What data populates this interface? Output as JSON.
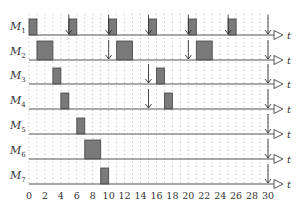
{
  "chart_data": {
    "type": "gantt",
    "title": "",
    "xlabel": "t",
    "ylabel": "",
    "xlim": [
      0,
      30
    ],
    "x_ticks": [
      0,
      2,
      4,
      6,
      8,
      10,
      12,
      14,
      16,
      18,
      20,
      22,
      24,
      26,
      28,
      30
    ],
    "grid": "dotted vertical at every unit",
    "rows": [
      {
        "name": "M1",
        "label_main": "M",
        "label_sub": "1",
        "blocks": [
          [
            0,
            1
          ],
          [
            5,
            6
          ],
          [
            10,
            11
          ],
          [
            15,
            16
          ],
          [
            20,
            21
          ],
          [
            25,
            26
          ]
        ],
        "arrows": [
          5,
          10,
          15,
          20,
          25,
          30
        ]
      },
      {
        "name": "M2",
        "label_main": "M",
        "label_sub": "2",
        "blocks": [
          [
            1,
            3
          ],
          [
            11,
            13
          ],
          [
            21,
            23
          ]
        ],
        "arrows": [
          10,
          20,
          30
        ]
      },
      {
        "name": "M3",
        "label_main": "M",
        "label_sub": "3",
        "blocks": [
          [
            3,
            4
          ],
          [
            16,
            17
          ]
        ],
        "arrows": [
          15,
          30
        ]
      },
      {
        "name": "M4",
        "label_main": "M",
        "label_sub": "4",
        "blocks": [
          [
            4,
            5
          ],
          [
            17,
            18
          ]
        ],
        "arrows": [
          15,
          30
        ]
      },
      {
        "name": "M5",
        "label_main": "M",
        "label_sub": "5",
        "blocks": [
          [
            6,
            7
          ]
        ],
        "arrows": [
          30
        ]
      },
      {
        "name": "M6",
        "label_main": "M",
        "label_sub": "6",
        "blocks": [
          [
            7,
            9
          ]
        ],
        "arrows": [
          30
        ]
      },
      {
        "name": "M7",
        "label_main": "M",
        "label_sub": "7",
        "blocks": [
          [
            9,
            10
          ]
        ],
        "arrows": [
          30
        ]
      }
    ]
  },
  "colors": {
    "block_fill": "#7a7a7a",
    "block_stroke": "#444444",
    "axis": "#555555",
    "grid_dot": "#b5b5b5",
    "text": "#333333"
  }
}
